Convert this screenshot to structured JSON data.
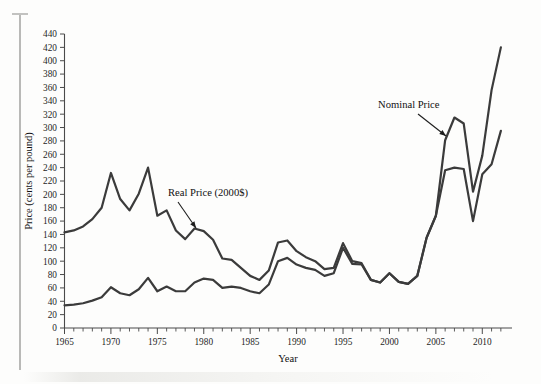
{
  "figure": {
    "background_color": "#fdfdfc",
    "line_color": "#3b3b3b",
    "axis_color": "#4a4a4a"
  },
  "axes": {
    "x_title": "Year",
    "y_title": "Price (cents per pound)",
    "y_tick_labels": [
      "0",
      "20",
      "40",
      "60",
      "80",
      "100",
      "120",
      "140",
      "160",
      "180",
      "200",
      "220",
      "240",
      "260",
      "280",
      "300",
      "320",
      "340",
      "360",
      "380",
      "400",
      "420",
      "440"
    ],
    "x_tick_labels": [
      "1965",
      "1970",
      "1975",
      "1980",
      "1985",
      "1990",
      "1995",
      "2000",
      "2005",
      "2010"
    ]
  },
  "annotations": [
    {
      "name": "real-price-annotation",
      "text": "Real Price (2000$)",
      "text_x": 168,
      "text_y": 196,
      "arrow_x1": 178,
      "arrow_y1": 202,
      "arrow_x2": 196,
      "arrow_y2": 228
    },
    {
      "name": "nominal-price-annotation",
      "text": "Nominal Price",
      "text_x": 378,
      "text_y": 108,
      "arrow_x1": 418,
      "arrow_y1": 114,
      "arrow_x2": 446,
      "arrow_y2": 136
    }
  ],
  "chart_data": {
    "type": "line",
    "title": "",
    "xlabel": "Year",
    "ylabel": "Price (cents per pound)",
    "xlim": [
      1965,
      2012
    ],
    "ylim": [
      0,
      440
    ],
    "ytick_step": 20,
    "xtick_step": 5,
    "x_minor_tick_step": 1,
    "grid": false,
    "legend": "annotated-inline",
    "x": [
      1965,
      1966,
      1967,
      1968,
      1969,
      1970,
      1971,
      1972,
      1973,
      1974,
      1975,
      1976,
      1977,
      1978,
      1979,
      1980,
      1981,
      1982,
      1983,
      1984,
      1985,
      1986,
      1987,
      1988,
      1989,
      1990,
      1991,
      1992,
      1993,
      1994,
      1995,
      1996,
      1997,
      1998,
      1999,
      2000,
      2001,
      2002,
      2003,
      2004,
      2005,
      2006,
      2007,
      2008,
      2009,
      2010,
      2011,
      2012
    ],
    "series": [
      {
        "name": "Real Price (2000$)",
        "units": "cents per pound (2000 dollars)",
        "values": [
          143,
          146,
          152,
          163,
          180,
          232,
          193,
          176,
          201,
          240,
          168,
          176,
          146,
          133,
          149,
          145,
          132,
          104,
          102,
          90,
          78,
          72,
          86,
          128,
          131,
          115,
          106,
          100,
          88,
          90,
          127,
          100,
          97,
          72,
          68,
          82,
          69,
          66,
          78,
          135,
          168,
          281,
          315,
          306,
          204,
          258,
          356,
          420
        ]
      },
      {
        "name": "Nominal Price",
        "units": "cents per pound (current dollars)",
        "values": [
          34,
          35,
          37,
          41,
          46,
          61,
          52,
          49,
          58,
          75,
          55,
          62,
          55,
          55,
          68,
          74,
          72,
          60,
          62,
          60,
          55,
          52,
          65,
          100,
          105,
          95,
          90,
          87,
          78,
          82,
          120,
          96,
          95,
          72,
          68,
          82,
          69,
          66,
          78,
          135,
          168,
          236,
          240,
          238,
          160,
          230,
          245,
          295
        ]
      }
    ]
  }
}
